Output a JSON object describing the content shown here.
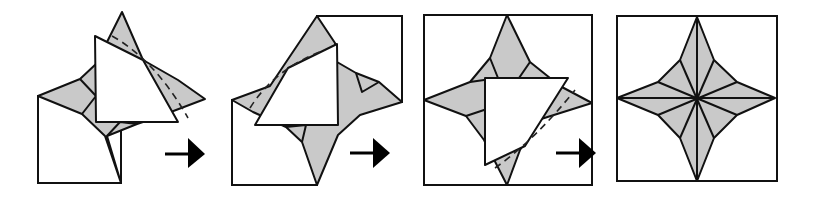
{
  "figure": {
    "steps": [
      {
        "id": 1,
        "label": "Step 1: fold flap over left side"
      },
      {
        "id": 2,
        "label": "Step 2: flap folded toward top-left"
      },
      {
        "id": 3,
        "label": "Step 3: flap folded toward bottom-right"
      },
      {
        "id": 4,
        "label": "Step 4: finished four-pointed star"
      }
    ],
    "arrows": [
      "arrow-right",
      "arrow-right",
      "arrow-right"
    ],
    "colors": {
      "fill_gray": "#c9c9c9",
      "line": "#111111",
      "paper": "#ffffff"
    }
  }
}
